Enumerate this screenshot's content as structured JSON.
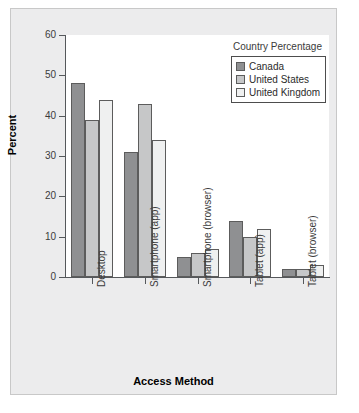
{
  "chart_data": {
    "type": "bar",
    "title": "",
    "xlabel": "Access Method",
    "ylabel": "Percent",
    "ylim": [
      0,
      60
    ],
    "yticks": [
      0,
      10,
      20,
      30,
      40,
      50,
      60
    ],
    "grid": false,
    "legend_title": "Country Percentage",
    "legend_position": "top-right",
    "categories": [
      "Desktop",
      "Smartphone (app)",
      "Smartphone (browser)",
      "Tablet (app)",
      "Tablet (browser)"
    ],
    "series": [
      {
        "name": "Canada",
        "color": "#8f9092",
        "values": [
          48,
          31,
          5,
          14,
          2
        ]
      },
      {
        "name": "United States",
        "color": "#c6c7c8",
        "values": [
          39,
          43,
          6,
          10,
          2
        ]
      },
      {
        "name": "United Kingdom",
        "color": "#eff0f0",
        "values": [
          44,
          34,
          7,
          12,
          3
        ]
      }
    ]
  },
  "style": {
    "panel_background": "#ececed",
    "plot_background": "#ffffff",
    "axis_color": "#55585b",
    "bar_border": "#5c5c5c"
  }
}
